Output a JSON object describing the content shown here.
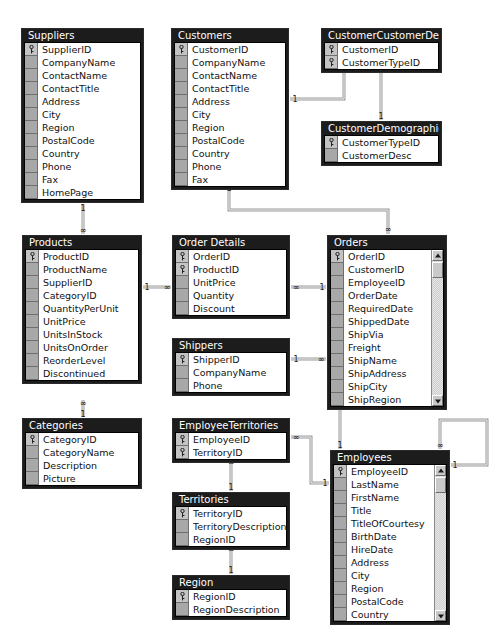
{
  "app": {
    "view_name": "Relationships",
    "database": "Northwind"
  },
  "colors": {
    "table_header_bg": "#1c1c1c",
    "table_header_text": "#ffffff",
    "table_body_bg": "#ffffff",
    "gutter_bg": "#a8a8a8",
    "pk_gutter_bg": "#c3c3c3",
    "relationship_line": "#9a9a9a",
    "scrollbar_track": "#e6e6e6"
  },
  "icons": {
    "primary_key": "key-icon",
    "scroll_up": "scroll-up-arrow-icon",
    "scroll_down": "scroll-down-arrow-icon"
  },
  "cardinality": {
    "one": "1",
    "many": "∞"
  },
  "tables": [
    {
      "id": "suppliers",
      "name": "Suppliers",
      "x": 21,
      "y": 28,
      "w": 123,
      "scrollbar": false,
      "fields": [
        {
          "name": "SupplierID",
          "pk": true
        },
        {
          "name": "CompanyName",
          "pk": false
        },
        {
          "name": "ContactName",
          "pk": false
        },
        {
          "name": "ContactTitle",
          "pk": false
        },
        {
          "name": "Address",
          "pk": false
        },
        {
          "name": "City",
          "pk": false
        },
        {
          "name": "Region",
          "pk": false
        },
        {
          "name": "PostalCode",
          "pk": false
        },
        {
          "name": "Country",
          "pk": false
        },
        {
          "name": "Phone",
          "pk": false
        },
        {
          "name": "Fax",
          "pk": false
        },
        {
          "name": "HomePage",
          "pk": false
        }
      ]
    },
    {
      "id": "customers",
      "name": "Customers",
      "x": 171,
      "y": 28,
      "w": 118,
      "scrollbar": false,
      "fields": [
        {
          "name": "CustomerID",
          "pk": true
        },
        {
          "name": "CompanyName",
          "pk": false
        },
        {
          "name": "ContactName",
          "pk": false
        },
        {
          "name": "ContactTitle",
          "pk": false
        },
        {
          "name": "Address",
          "pk": false
        },
        {
          "name": "City",
          "pk": false
        },
        {
          "name": "Region",
          "pk": false
        },
        {
          "name": "PostalCode",
          "pk": false
        },
        {
          "name": "Country",
          "pk": false
        },
        {
          "name": "Phone",
          "pk": false
        },
        {
          "name": "Fax",
          "pk": false
        }
      ]
    },
    {
      "id": "customercustomerdemo",
      "name": "CustomerCustomerDemo",
      "x": 321,
      "y": 28,
      "w": 121,
      "scrollbar": false,
      "fields": [
        {
          "name": "CustomerID",
          "pk": true
        },
        {
          "name": "CustomerTypeID",
          "pk": true
        }
      ]
    },
    {
      "id": "customerdemographics",
      "name": "CustomerDemographics",
      "x": 321,
      "y": 121,
      "w": 121,
      "scrollbar": false,
      "fields": [
        {
          "name": "CustomerTypeID",
          "pk": true
        },
        {
          "name": "CustomerDesc",
          "pk": false
        }
      ]
    },
    {
      "id": "products",
      "name": "Products",
      "x": 22,
      "y": 235,
      "w": 120,
      "scrollbar": false,
      "fields": [
        {
          "name": "ProductID",
          "pk": true
        },
        {
          "name": "ProductName",
          "pk": false
        },
        {
          "name": "SupplierID",
          "pk": false
        },
        {
          "name": "CategoryID",
          "pk": false
        },
        {
          "name": "QuantityPerUnit",
          "pk": false
        },
        {
          "name": "UnitPrice",
          "pk": false
        },
        {
          "name": "UnitsInStock",
          "pk": false
        },
        {
          "name": "UnitsOnOrder",
          "pk": false
        },
        {
          "name": "ReorderLevel",
          "pk": false
        },
        {
          "name": "Discontinued",
          "pk": false
        }
      ]
    },
    {
      "id": "orderdetails",
      "name": "Order Details",
      "x": 172,
      "y": 235,
      "w": 118,
      "scrollbar": false,
      "fields": [
        {
          "name": "OrderID",
          "pk": true
        },
        {
          "name": "ProductID",
          "pk": true
        },
        {
          "name": "UnitPrice",
          "pk": false
        },
        {
          "name": "Quantity",
          "pk": false
        },
        {
          "name": "Discount",
          "pk": false
        }
      ]
    },
    {
      "id": "orders",
      "name": "Orders",
      "x": 327,
      "y": 235,
      "w": 120,
      "scrollbar": true,
      "fields": [
        {
          "name": "OrderID",
          "pk": true
        },
        {
          "name": "CustomerID",
          "pk": false
        },
        {
          "name": "EmployeeID",
          "pk": false
        },
        {
          "name": "OrderDate",
          "pk": false
        },
        {
          "name": "RequiredDate",
          "pk": false
        },
        {
          "name": "ShippedDate",
          "pk": false
        },
        {
          "name": "ShipVia",
          "pk": false
        },
        {
          "name": "Freight",
          "pk": false
        },
        {
          "name": "ShipName",
          "pk": false
        },
        {
          "name": "ShipAddress",
          "pk": false
        },
        {
          "name": "ShipCity",
          "pk": false
        },
        {
          "name": "ShipRegion",
          "pk": false
        }
      ]
    },
    {
      "id": "shippers",
      "name": "Shippers",
      "x": 172,
      "y": 338,
      "w": 118,
      "scrollbar": false,
      "fields": [
        {
          "name": "ShipperID",
          "pk": true
        },
        {
          "name": "CompanyName",
          "pk": false
        },
        {
          "name": "Phone",
          "pk": false
        }
      ]
    },
    {
      "id": "categories",
      "name": "Categories",
      "x": 22,
      "y": 418,
      "w": 120,
      "scrollbar": false,
      "fields": [
        {
          "name": "CategoryID",
          "pk": true
        },
        {
          "name": "CategoryName",
          "pk": false
        },
        {
          "name": "Description",
          "pk": false
        },
        {
          "name": "Picture",
          "pk": false
        }
      ]
    },
    {
      "id": "employeeterritories",
      "name": "EmployeeTerritories",
      "x": 172,
      "y": 418,
      "w": 118,
      "scrollbar": false,
      "fields": [
        {
          "name": "EmployeeID",
          "pk": true
        },
        {
          "name": "TerritoryID",
          "pk": true
        }
      ]
    },
    {
      "id": "territories",
      "name": "Territories",
      "x": 172,
      "y": 492,
      "w": 118,
      "scrollbar": false,
      "fields": [
        {
          "name": "TerritoryID",
          "pk": true
        },
        {
          "name": "TerritoryDescription",
          "pk": false
        },
        {
          "name": "RegionID",
          "pk": false
        }
      ]
    },
    {
      "id": "region",
      "name": "Region",
      "x": 172,
      "y": 575,
      "w": 118,
      "scrollbar": false,
      "fields": [
        {
          "name": "RegionID",
          "pk": true
        },
        {
          "name": "RegionDescription",
          "pk": false
        }
      ]
    },
    {
      "id": "employees",
      "name": "Employees",
      "x": 330,
      "y": 450,
      "w": 120,
      "scrollbar": true,
      "fields": [
        {
          "name": "EmployeeID",
          "pk": true
        },
        {
          "name": "LastName",
          "pk": false
        },
        {
          "name": "FirstName",
          "pk": false
        },
        {
          "name": "Title",
          "pk": false
        },
        {
          "name": "TitleOfCourtesy",
          "pk": false
        },
        {
          "name": "BirthDate",
          "pk": false
        },
        {
          "name": "HireDate",
          "pk": false
        },
        {
          "name": "Address",
          "pk": false
        },
        {
          "name": "City",
          "pk": false
        },
        {
          "name": "Region",
          "pk": false
        },
        {
          "name": "PostalCode",
          "pk": false
        },
        {
          "name": "Country",
          "pk": false
        }
      ]
    }
  ],
  "relationships": [
    {
      "id": "suppliers-products",
      "from": "Suppliers.SupplierID",
      "to": "Products.SupplierID",
      "type": "one-to-many",
      "path": "M 83 204 L 83 234",
      "one_at": [
        83,
        208
      ],
      "many_at": [
        83,
        230
      ]
    },
    {
      "id": "categories-products",
      "from": "Categories.CategoryID",
      "to": "Products.CategoryID",
      "type": "one-to-many",
      "path": "M 83 400 L 83 417",
      "one_at": [
        83,
        414
      ],
      "many_at": [
        83,
        403
      ]
    },
    {
      "id": "products-orderdetails",
      "from": "Products.ProductID",
      "to": "OrderDetails.ProductID",
      "type": "one-to-many",
      "path": "M 143 287 L 171 287",
      "one_at": [
        147,
        287
      ],
      "many_at": [
        167,
        287
      ]
    },
    {
      "id": "orders-orderdetails",
      "from": "Orders.OrderID",
      "to": "OrderDetails.OrderID",
      "type": "one-to-many",
      "path": "M 291 287 L 326 287",
      "one_at": [
        322,
        287
      ],
      "many_at": [
        296,
        287
      ]
    },
    {
      "id": "customers-orders",
      "from": "Customers.CustomerID",
      "to": "Orders.CustomerID",
      "type": "one-to-many",
      "path": "M 229 183 L 229 210 L 388 210 L 388 234",
      "one_at": [
        229,
        188
      ],
      "many_at": [
        388,
        229
      ]
    },
    {
      "id": "customers-ccd",
      "from": "Customers.CustomerID",
      "to": "CustomerCustomerDemo.CustomerID",
      "type": "one-to-many",
      "path": "M 290 99 L 344 99 L 344 65",
      "one_at": [
        295,
        99
      ],
      "many_at": [
        344,
        70
      ]
    },
    {
      "id": "customerdemographics-ccd",
      "from": "CustomerDemographics.CustomerTypeID",
      "to": "CustomerCustomerDemo.CustomerTypeID",
      "type": "one-to-many",
      "path": "M 381 120 L 381 65",
      "one_at": [
        381,
        116
      ],
      "many_at": [
        381,
        70
      ]
    },
    {
      "id": "shippers-orders",
      "from": "Shippers.ShipperID",
      "to": "Orders.ShipVia",
      "type": "one-to-many",
      "path": "M 291 359 L 326 359",
      "one_at": [
        296,
        359
      ],
      "many_at": [
        321,
        359
      ]
    },
    {
      "id": "employees-orders",
      "from": "Employees.EmployeeID",
      "to": "Orders.EmployeeID",
      "type": "one-to-many",
      "path": "M 340 449 L 340 400",
      "one_at": [
        340,
        445
      ],
      "many_at": [
        340,
        405
      ]
    },
    {
      "id": "employees-employeeterritories",
      "from": "Employees.EmployeeID",
      "to": "EmployeeTerritories.EmployeeID",
      "type": "one-to-many",
      "path": "M 291 437 L 311 437 L 311 483 L 329 483",
      "one_at": [
        325,
        483
      ],
      "many_at": [
        296,
        437
      ]
    },
    {
      "id": "territories-employeeterritories",
      "from": "Territories.TerritoryID",
      "to": "EmployeeTerritories.TerritoryID",
      "type": "one-to-many",
      "path": "M 231 458 L 231 491",
      "one_at": [
        231,
        487
      ],
      "many_at": [
        231,
        462
      ]
    },
    {
      "id": "region-territories",
      "from": "Region.RegionID",
      "to": "Territories.RegionID",
      "type": "one-to-many",
      "path": "M 231 545 L 231 574",
      "one_at": [
        231,
        570
      ],
      "many_at": [
        231,
        549
      ]
    },
    {
      "id": "employees-employees-reportsto",
      "from": "Employees.EmployeeID",
      "to": "Employees.ReportsTo",
      "type": "one-to-many self-join",
      "path": "M 451 465 L 487 465 L 487 420 L 440 420 L 440 449",
      "one_at": [
        455,
        465
      ],
      "many_at": [
        440,
        445
      ]
    }
  ]
}
